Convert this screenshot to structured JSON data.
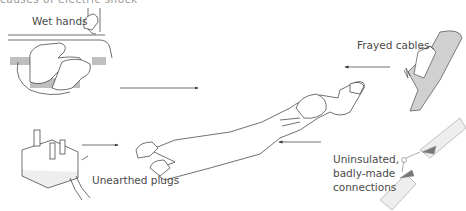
{
  "diagram": {
    "type": "illustration",
    "top_caption_fragment": "causes of electric shock",
    "center": {
      "name": "collapsed person",
      "description": "Person lying face down after electric shock"
    },
    "hazards": [
      {
        "id": "wet-hands",
        "label": "Wet hands",
        "position": "top-left",
        "arrow_direction": "right"
      },
      {
        "id": "frayed-cables",
        "label": "Frayed cables",
        "position": "top-right",
        "arrow_direction": "left"
      },
      {
        "id": "unearthed-plugs",
        "label": "Unearthed plugs",
        "position": "bottom-left",
        "arrow_direction": "right"
      },
      {
        "id": "uninsulated-connections",
        "label_lines": [
          "Uninsulated,",
          "badly-made",
          "connections"
        ],
        "position": "bottom-right",
        "arrow_direction": "left"
      }
    ],
    "colors": {
      "line": "#333333",
      "fill_grey": "#cfcfcf",
      "fill_dark": "#777777",
      "text": "#4a4a4a"
    }
  }
}
